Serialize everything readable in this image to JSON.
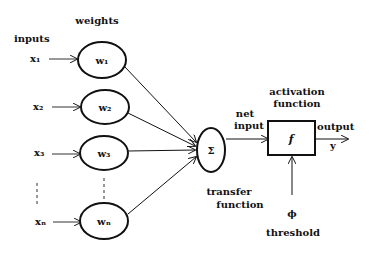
{
  "diagram": {
    "labels": {
      "weights": "weights",
      "inputs": "inputs",
      "net": "net",
      "input": "input",
      "activation": "activation",
      "function1": "function",
      "output": "output",
      "y": "y",
      "transfer": "transfer",
      "function2": "function",
      "phi": "ϕ",
      "threshold": "threshold"
    },
    "inputs": [
      {
        "label": "x₁",
        "weight": "w₁"
      },
      {
        "label": "x₂",
        "weight": "w₂"
      },
      {
        "label": "x₃",
        "weight": "w₃"
      },
      {
        "label": "xₙ",
        "weight": "wₙ"
      }
    ],
    "sum_symbol": "Σ",
    "activation_symbol": "f"
  }
}
